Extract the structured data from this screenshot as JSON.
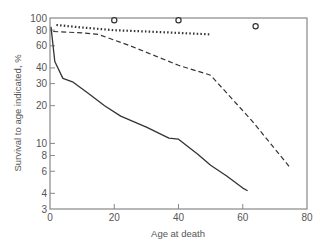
{
  "chart_data": {
    "type": "line",
    "title": "",
    "xlabel": "Age at death",
    "ylabel": "Survival to age indicated, %",
    "xlim": [
      0,
      80
    ],
    "ylim": [
      3,
      100
    ],
    "yscale": "log",
    "grid": false,
    "legend": null,
    "x_ticks": [
      0,
      20,
      40,
      60,
      80
    ],
    "x_tick_labels": [
      "0",
      "20",
      "40",
      "60",
      "80"
    ],
    "y_ticks": [
      3,
      4,
      6,
      8,
      10,
      20,
      30,
      40,
      60,
      80,
      100
    ],
    "y_tick_labels": [
      "3",
      "4",
      "6",
      "8",
      "10",
      "20",
      "30",
      "40",
      "60",
      "80",
      "100"
    ],
    "series": [
      {
        "name": "solid",
        "style": "solid",
        "x": [
          0.3,
          1.5,
          4,
          7,
          12,
          17,
          22,
          30,
          37,
          40,
          46,
          50,
          55,
          60,
          61.5
        ],
        "y": [
          85,
          45,
          33,
          31,
          25,
          20,
          16.5,
          13.5,
          11,
          10.8,
          8.2,
          6.7,
          5.5,
          4.4,
          4.2
        ]
      },
      {
        "name": "dashed",
        "style": "dashed",
        "x": [
          1,
          10,
          15,
          25,
          40,
          50,
          63,
          75
        ],
        "y": [
          78,
          76,
          74,
          60,
          42,
          35,
          15,
          6.3
        ]
      },
      {
        "name": "dotted",
        "style": "dotted",
        "x": [
          2,
          10,
          20,
          30,
          40,
          50
        ],
        "y": [
          88,
          84,
          80,
          78,
          76,
          74
        ]
      },
      {
        "name": "circles",
        "style": "markers",
        "marker": "open-circle",
        "x": [
          20,
          40,
          64
        ],
        "y": [
          96,
          96,
          86
        ]
      }
    ]
  },
  "colors": {
    "axis": "#888888",
    "line": "#333333",
    "text": "#555555"
  }
}
